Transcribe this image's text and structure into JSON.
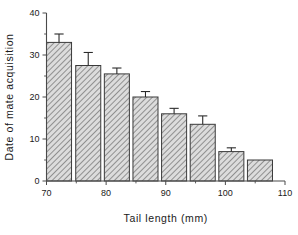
{
  "chart_data": {
    "type": "bar",
    "title": "",
    "subtitle": "",
    "xlabel": "Tail  length  (mm)",
    "ylabel": "Date of  mate  acquisition",
    "xlim": [
      70,
      110
    ],
    "ylim": [
      0,
      40
    ],
    "grid": false,
    "legend": null,
    "x_tick_labels": [
      "70",
      "80",
      "90",
      "100",
      "110"
    ],
    "x_tick_values": [
      70,
      80,
      90,
      100,
      110
    ],
    "x_minor_tick_values": [
      75,
      85,
      95,
      105
    ],
    "y_tick_labels": [
      "0",
      "10",
      "20",
      "30",
      "40"
    ],
    "y_tick_values": [
      0,
      10,
      20,
      30,
      40
    ],
    "y_minor_tick_values": [
      5,
      15,
      25,
      35
    ],
    "bar_width": 4.2,
    "categories": [
      72.1,
      77.0,
      81.8,
      86.6,
      91.4,
      96.2,
      101.0,
      105.8
    ],
    "values": [
      33.0,
      27.5,
      25.5,
      20.0,
      16.0,
      13.5,
      7.0,
      5.0
    ],
    "errors": [
      2.0,
      3.1,
      1.4,
      1.3,
      1.3,
      2.0,
      0.9,
      null
    ],
    "bar_fill": "#d8d8d8",
    "bar_edge": "#3a3a3a",
    "bar_hatch": "diagonal",
    "error_color": "#2b2b2b",
    "axis_color": "#4a4a4a",
    "background": "#ffffff"
  }
}
